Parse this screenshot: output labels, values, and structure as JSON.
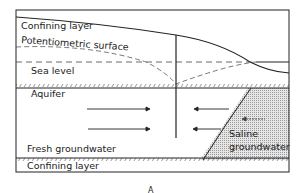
{
  "diagram": {
    "labels": {
      "confining_top": "Confining layer",
      "potentiometric": "Potentiometric surface",
      "sea_level": "Sea level",
      "aquifer": "Aquifer",
      "fresh": "Fresh groundwater",
      "saline_1": "Saline",
      "saline_2": "groundwater",
      "confining_bottom": "Confining layer",
      "panel": "A"
    },
    "colors": {
      "line": "#222222",
      "saline_fill": "#d9d9d9"
    }
  }
}
